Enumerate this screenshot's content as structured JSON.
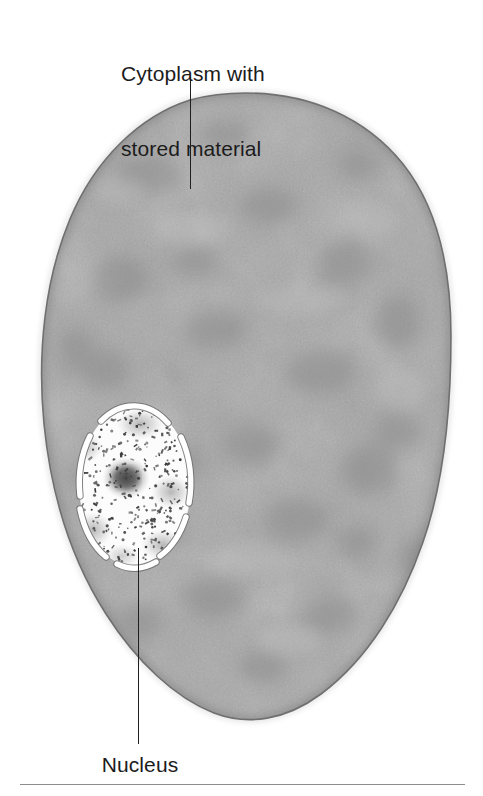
{
  "figure": {
    "width": 483,
    "height": 796,
    "background_color": "#ffffff"
  },
  "labels": {
    "cytoplasm": {
      "line1": "Cytoplasm with",
      "line2": "stored material",
      "color": "#1c1c1c",
      "font_size_px": 21
    },
    "nucleus": {
      "text": "Nucleus",
      "color": "#1c1c1c",
      "font_size_px": 21
    }
  },
  "leader_lines": {
    "cytoplasm": {
      "x": 190,
      "y_start": 77,
      "y_end": 189,
      "color": "#1f1f1f"
    },
    "nucleus": {
      "x": 138,
      "y_start": 548,
      "y_end": 744,
      "color": "#1f1f1f"
    }
  },
  "structures": {
    "cell": {
      "name": "cell-body",
      "shape": "irregular-oval",
      "fill_color": "#a9a9a9",
      "outline_color": "#6e6e6e",
      "bounds": {
        "left": 42,
        "top": 93,
        "right": 451,
        "bottom": 721
      }
    },
    "nucleus": {
      "name": "nucleus",
      "shape": "oval",
      "fill_color": "#fdfdfd",
      "membrane_color": "#ffffff",
      "membrane_outline_color": "#707070",
      "bounds": {
        "left": 78,
        "top": 405,
        "right": 192,
        "bottom": 568
      },
      "membrane_style": "broken-arc-segments"
    },
    "nucleolus": {
      "name": "nucleolus",
      "shape": "diffuse-blob",
      "color": "#4a4a4a",
      "center": {
        "x": 125,
        "y": 478
      },
      "diameter_px": 36
    },
    "chromatin": {
      "name": "chromatin-speckles",
      "description": "scattered dark dashes and dots inside the nucleus",
      "color": "#3a3a3a",
      "count": 260
    }
  },
  "bottom_rule": {
    "color": "#8d8d8d",
    "left": 20,
    "right": 465,
    "y": 784
  }
}
